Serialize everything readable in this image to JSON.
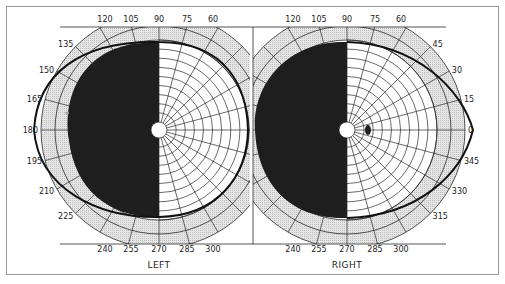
{
  "figure": {
    "type": "visual_field_perimetry_chart",
    "colors": {
      "frame": "#9a9a9a",
      "grid": "#2a2a2a",
      "shade": "#dcdcdc",
      "scotoma": "#1e1e1e",
      "isopter": "#111111",
      "background": "#ffffff"
    },
    "angle_ticks_step_deg": 15,
    "ring_count_inner": 9,
    "ring_count_outer": 2,
    "eyes": [
      {
        "id": "left",
        "label": "LEFT",
        "center": [
          159,
          130
        ],
        "angle_labels": [
          "120",
          "105",
          "90",
          "75",
          "60",
          "135",
          "150",
          "165",
          "180",
          "195",
          "210",
          "225",
          "240",
          "255",
          "270",
          "285",
          "300"
        ],
        "hemianopia_side": "left",
        "isopter_note": "field boundary ellipse; temporal (left) half blacked out",
        "marks": [
          {
            "x": 67,
            "y": 113,
            "kind": "faint-dot"
          }
        ]
      },
      {
        "id": "right",
        "label": "RIGHT",
        "center": [
          347,
          130
        ],
        "angle_labels": [
          "120",
          "105",
          "90",
          "75",
          "60",
          "45",
          "30",
          "15",
          "0",
          "345",
          "330",
          "315",
          "240",
          "255",
          "270",
          "285",
          "300"
        ],
        "hemianopia_side": "left",
        "isopter_note": "field boundary; nasal (left) half blacked out",
        "marks": [
          {
            "x": 368,
            "y": 130,
            "kind": "blind-spot"
          }
        ]
      }
    ]
  }
}
